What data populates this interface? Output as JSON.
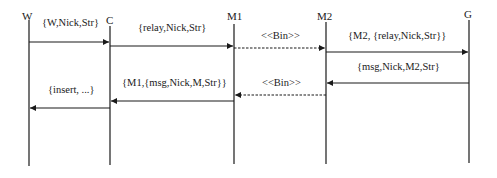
{
  "diagram": {
    "type": "sequence",
    "actors": [
      {
        "id": "W",
        "label": "W",
        "x": 29,
        "label_x": 22,
        "label_y": 10,
        "top": 20,
        "bottom": 166
      },
      {
        "id": "C",
        "label": "C",
        "x": 110,
        "label_x": 106,
        "label_y": 14,
        "top": 26,
        "bottom": 165
      },
      {
        "id": "M1",
        "label": "M1",
        "x": 234,
        "label_x": 227,
        "label_y": 10,
        "top": 24,
        "bottom": 164
      },
      {
        "id": "M2",
        "label": "M2",
        "x": 326,
        "label_x": 317,
        "label_y": 10,
        "top": 22,
        "bottom": 164
      },
      {
        "id": "G",
        "label": "G",
        "x": 469,
        "label_x": 464,
        "label_y": 8,
        "top": 20,
        "bottom": 163
      }
    ],
    "messages": [
      {
        "from": "W",
        "to": "C",
        "y": 42,
        "style": "solid",
        "label": "{W,Nick,Str}",
        "label_x": 42,
        "label_y": 17
      },
      {
        "from": "C",
        "to": "M1",
        "y": 46,
        "style": "solid",
        "label": "{relay,Nick,Str}",
        "label_x": 138,
        "label_y": 22
      },
      {
        "from": "M1",
        "to": "M2",
        "y": 48,
        "style": "dashed",
        "label": "<<Bin>>",
        "label_x": 261,
        "label_y": 30
      },
      {
        "from": "M2",
        "to": "G",
        "y": 52,
        "style": "solid",
        "label": "{M2, {relay,Nick,Str}}",
        "label_x": 348,
        "label_y": 30
      },
      {
        "from": "G",
        "to": "M2",
        "y": 83,
        "style": "solid",
        "label": "{msg,Nick,M2,Str}",
        "label_x": 357,
        "label_y": 61
      },
      {
        "from": "M2",
        "to": "M1",
        "y": 95,
        "style": "dashed",
        "label": "<<Bin>>",
        "label_x": 262,
        "label_y": 77
      },
      {
        "from": "M1",
        "to": "C",
        "y": 101,
        "style": "solid",
        "label": "{M1,{msg,Nick,M,Str}}",
        "label_x": 122,
        "label_y": 77
      },
      {
        "from": "C",
        "to": "W",
        "y": 108,
        "style": "solid",
        "label": "{insert, ...}",
        "label_x": 48,
        "label_y": 84
      }
    ],
    "colors": {
      "line": "#1a1a1a",
      "background": "#ffffff"
    }
  }
}
